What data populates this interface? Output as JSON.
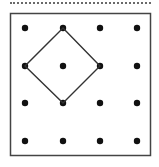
{
  "figure": {
    "type": "geoboard",
    "colors": {
      "frame": "#444444",
      "dots": "#111111",
      "shape_line": "#333333",
      "dotted_rule": "#6a6a6a",
      "background": "#ffffff"
    },
    "grid": {
      "rows": 4,
      "cols": 4,
      "dots": [
        {
          "row": 0,
          "col": 0
        },
        {
          "row": 0,
          "col": 1
        },
        {
          "row": 0,
          "col": 2
        },
        {
          "row": 0,
          "col": 3
        },
        {
          "row": 1,
          "col": 0
        },
        {
          "row": 1,
          "col": 1
        },
        {
          "row": 1,
          "col": 2
        },
        {
          "row": 1,
          "col": 3
        },
        {
          "row": 2,
          "col": 0
        },
        {
          "row": 2,
          "col": 1
        },
        {
          "row": 2,
          "col": 2
        },
        {
          "row": 2,
          "col": 3
        },
        {
          "row": 3,
          "col": 0
        },
        {
          "row": 3,
          "col": 1
        },
        {
          "row": 3,
          "col": 2
        },
        {
          "row": 3,
          "col": 3
        }
      ]
    },
    "shape": {
      "name": "square rotated 45 degrees (diamond)",
      "vertices": [
        {
          "row": 0,
          "col": 1
        },
        {
          "row": 1,
          "col": 2
        },
        {
          "row": 2,
          "col": 1
        },
        {
          "row": 1,
          "col": 0
        }
      ]
    }
  }
}
